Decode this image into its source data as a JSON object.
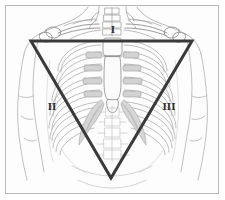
{
  "figure": {
    "background_color": "#ffffff",
    "frame_color": "#b8b8b8",
    "width": 225,
    "height": 200
  },
  "illustration": {
    "subject": "anterior view of human torso skeleton",
    "style": "line drawing, grayscale",
    "line_color": "#8a8a8a",
    "shade_color": "#cfcfcf",
    "parts": [
      "shoulders",
      "clavicles",
      "sternum",
      "rib-cage",
      "costal-cartilage",
      "thoracic-spine",
      "lumbar-spine",
      "diaphragm",
      "upper-arms",
      "pelvis-outline"
    ]
  },
  "overlay": {
    "shape": "inverted-triangle",
    "stroke_color": "#3a3a3a",
    "stroke_width": 3,
    "vertices": [
      {
        "x": 31,
        "y": 41
      },
      {
        "x": 192,
        "y": 41
      },
      {
        "x": 111,
        "y": 178
      }
    ]
  },
  "labels": {
    "top": "I",
    "left": "II",
    "right": "III"
  },
  "chart_data": {
    "type": "diagram",
    "annotations": [
      {
        "id": "I",
        "label": "I",
        "position": "top-center",
        "x": 112,
        "y": 30
      },
      {
        "id": "II",
        "label": "II",
        "position": "left-lateral",
        "x": 52,
        "y": 107
      },
      {
        "id": "III",
        "label": "III",
        "position": "right-lateral",
        "x": 169,
        "y": 107
      }
    ]
  }
}
